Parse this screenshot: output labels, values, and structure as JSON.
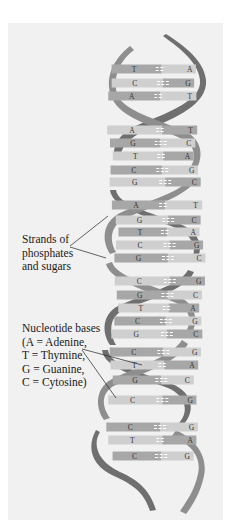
{
  "figure": {
    "background": "#f1f1f1",
    "colors": {
      "strand_dark": "#6e6e6e",
      "strand_light": "#9a9a9a",
      "rung_dark": "#a7a7a7",
      "rung_light": "#cfcfcf",
      "text": "#1a1a1a"
    }
  },
  "labels": {
    "strands": {
      "lines": [
        "Strands of",
        "phosphates",
        "and sugars"
      ]
    },
    "bases": {
      "lines": [
        "Nucleotide bases",
        "(A = Adenine,",
        "T = Thymine,",
        "G = Guanine,",
        "C = Cytosine)"
      ]
    }
  },
  "base_pairs": [
    {
      "left": "T",
      "right": "A",
      "y": 69
    },
    {
      "left": "C",
      "right": "G",
      "y": 83
    },
    {
      "left": "A",
      "right": "T",
      "y": 96
    },
    {
      "left": "A",
      "right": "T",
      "y": 130
    },
    {
      "left": "G",
      "right": "C",
      "y": 143
    },
    {
      "left": "T",
      "right": "A",
      "y": 156
    },
    {
      "left": "C",
      "right": "G",
      "y": 170
    },
    {
      "left": "G",
      "right": "C",
      "y": 182
    },
    {
      "left": "A",
      "right": "T",
      "y": 205
    },
    {
      "left": "G",
      "right": "C",
      "y": 220
    },
    {
      "left": "T",
      "right": "A",
      "y": 232
    },
    {
      "left": "C",
      "right": "G",
      "y": 245
    },
    {
      "left": "G",
      "right": "C",
      "y": 258
    },
    {
      "left": "C",
      "right": "G",
      "y": 281
    },
    {
      "left": "G",
      "right": "C",
      "y": 295
    },
    {
      "left": "T",
      "right": "A",
      "y": 308
    },
    {
      "left": "C",
      "right": "G",
      "y": 321
    },
    {
      "left": "G",
      "right": "C",
      "y": 334
    },
    {
      "left": "C",
      "right": "G",
      "y": 352
    },
    {
      "left": "T",
      "right": "A",
      "y": 365
    },
    {
      "left": "G",
      "right": "C",
      "y": 380
    },
    {
      "left": "C",
      "right": "G",
      "y": 400
    },
    {
      "left": "C",
      "right": "G",
      "y": 427
    },
    {
      "left": "T",
      "right": "A",
      "y": 440
    },
    {
      "left": "C",
      "right": "G",
      "y": 456
    }
  ]
}
